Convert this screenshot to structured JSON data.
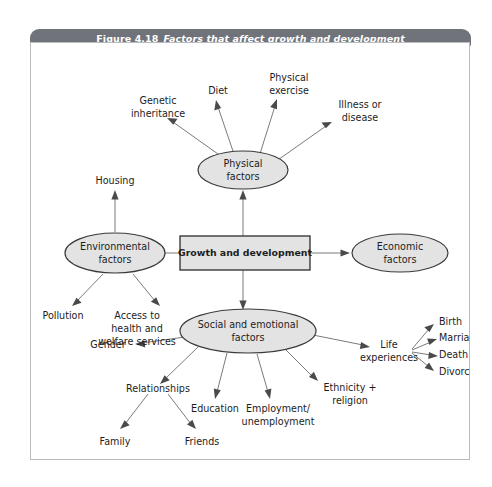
{
  "figure": {
    "number": "Figure 4.18",
    "title": "Factors that affect growth and development",
    "banner_color": "#70747a",
    "node_fill": "#e3e3e3",
    "node_stroke": "#3a3a3a",
    "connector_color": "#7b7b7b"
  },
  "diagram": {
    "type": "mind-map",
    "center": {
      "label": "Growth and development",
      "shape": "rectangle"
    },
    "branches": [
      {
        "id": "physical",
        "label_line1": "Physical",
        "label_line2": "factors",
        "shape": "ellipse",
        "children": [
          {
            "label_line1": "Genetic",
            "label_line2": "inheritance"
          },
          {
            "label_line1": "Diet",
            "label_line2": ""
          },
          {
            "label_line1": "Physical",
            "label_line2": "exercise"
          },
          {
            "label_line1": "Illness or",
            "label_line2": "disease"
          }
        ]
      },
      {
        "id": "environmental",
        "label_line1": "Environmental",
        "label_line2": "factors",
        "shape": "ellipse",
        "children": [
          {
            "label_line1": "Housing",
            "label_line2": "",
            "label_line3": ""
          },
          {
            "label_line1": "Pollution",
            "label_line2": "",
            "label_line3": ""
          },
          {
            "label_line1": "Access to",
            "label_line2": "health and",
            "label_line3": "welfare services"
          }
        ]
      },
      {
        "id": "economic",
        "label_line1": "Economic",
        "label_line2": "factors",
        "shape": "ellipse",
        "children": []
      },
      {
        "id": "social",
        "label_line1": "Social and emotional",
        "label_line2": "factors",
        "shape": "ellipse",
        "children": [
          {
            "label_line1": "Gender",
            "label_line2": ""
          },
          {
            "label_line1": "Relationships",
            "label_line2": ""
          },
          {
            "label_line1": "Education",
            "label_line2": ""
          },
          {
            "label_line1": "Employment/",
            "label_line2": "unemployment"
          },
          {
            "label_line1": "Ethnicity +",
            "label_line2": "religion"
          },
          {
            "label_line1": "Life",
            "label_line2": "experiences"
          }
        ],
        "grandchildren": {
          "relationships": [
            {
              "label": "Family"
            },
            {
              "label": "Friends"
            }
          ],
          "life_experiences": [
            {
              "label": "Birth"
            },
            {
              "label": "Marriage"
            },
            {
              "label": "Death"
            },
            {
              "label": "Divorce"
            }
          ]
        }
      }
    ]
  }
}
